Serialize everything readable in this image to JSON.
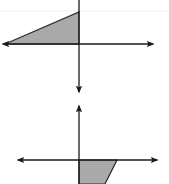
{
  "colors": {
    "background": "#ffffff",
    "axis": "#1a1a1a",
    "fill": "#a9a9a9",
    "outline": "#2a2a2a",
    "faint_line": "#eeeeee"
  },
  "graphs": [
    {
      "name": "top-coordinate-plane",
      "x_axis": {
        "y": 44,
        "x1": 3,
        "x2": 153
      },
      "y_axis": {
        "x": 79,
        "y1": 0,
        "y2": 92
      },
      "shape": {
        "type": "triangle",
        "points": "5,44 79,44 79,12"
      }
    },
    {
      "name": "bottom-coordinate-plane",
      "x_axis": {
        "y": 160,
        "x1": 18,
        "x2": 157
      },
      "y_axis": {
        "x": 79,
        "y1": 106,
        "y2": 184
      },
      "shape": {
        "type": "trapezoid",
        "points": "79,160 117,160 105,184 79,184"
      }
    }
  ]
}
